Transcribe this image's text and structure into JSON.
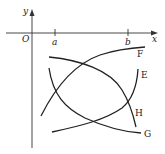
{
  "diagram": {
    "axes": {
      "x_label": "x",
      "y_label": "y",
      "origin_label": "O",
      "ticks": [
        {
          "label": "a"
        },
        {
          "label": "b"
        }
      ]
    },
    "curves": [
      {
        "label": "F",
        "shape": "increasing, concave down"
      },
      {
        "label": "E",
        "shape": "increasing, concave up"
      },
      {
        "label": "H",
        "shape": "decreasing, concave down"
      },
      {
        "label": "G",
        "shape": "decreasing, concave up"
      }
    ],
    "colors": {
      "stroke": "#222222",
      "background": "#ffffff"
    }
  }
}
